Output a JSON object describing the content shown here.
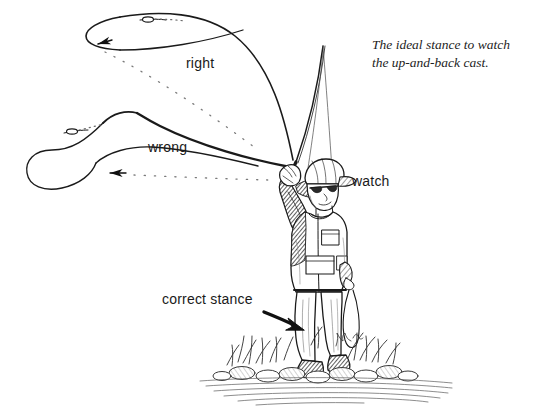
{
  "illustration": {
    "title": "Fly casting stance instructional illustration",
    "medium": "pen-and-ink line drawing",
    "background_color": "#ffffff",
    "ink_color": "#1a1a1a",
    "width": 550,
    "height": 408
  },
  "caption": {
    "line1": "The ideal stance to watch",
    "line2": "the up-and-back cast."
  },
  "labels": {
    "right": "right",
    "wrong": "wrong",
    "watch": "watch",
    "correct_stance": "correct stance"
  },
  "annotations": [
    {
      "name": "right-loop",
      "label": "right",
      "description": "Tight narrow back-cast loop travelling up and back, fly and leader at the tip",
      "loop_shape": "narrow",
      "direction_arrow": "left"
    },
    {
      "name": "wrong-loop",
      "label": "wrong",
      "description": "Wide open rounded back-cast loop travelling low and back",
      "loop_shape": "wide",
      "direction_arrow": "left"
    },
    {
      "name": "watch-callout",
      "label": "watch",
      "description": "Angler's head turned up and back, eyes on the back cast"
    },
    {
      "name": "correct-stance-callout",
      "label": "correct stance",
      "description": "Arrow pointing to the angler's feet planted on the bank",
      "direction_arrow": "right"
    }
  ],
  "figure": {
    "name": "angler",
    "pose": "standing on stream bank, rod arm raised, head turned back to watch the cast",
    "parts": [
      "billed-cap",
      "sunglasses",
      "fishing-vest",
      "trousers",
      "boots",
      "casting-hand-on-rod",
      "line-hand-holding-slack-loop"
    ]
  },
  "ground": {
    "name": "stream-bank",
    "elements": [
      "grass-tufts",
      "rocks",
      "water-surface-lines"
    ]
  },
  "tackle": {
    "rod": "fly-rod arcing up and to the left",
    "line": "fly line forming back-cast loops",
    "slack_loop": "loop of slack line hanging from line hand"
  }
}
